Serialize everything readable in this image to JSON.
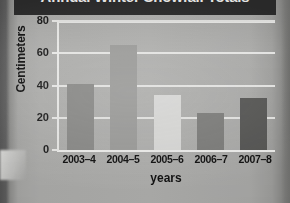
{
  "chart": {
    "title": "Annual Winter Snowfall Totals",
    "xlabel": "years",
    "ylabel": "Centimeters"
  },
  "chart_data": {
    "type": "bar",
    "title": "Annual Winter Snowfall Totals",
    "xlabel": "years",
    "ylabel": "Centimeters",
    "categories": [
      "2003–4",
      "2004–5",
      "2005–6",
      "2006–7",
      "2007–8"
    ],
    "values": [
      41,
      65,
      34,
      23,
      32
    ],
    "ylim": [
      0,
      80
    ],
    "yticks": [
      0,
      20,
      40,
      60,
      80
    ],
    "ytick_labels": [
      "0",
      "20",
      "40",
      "60",
      "80"
    ],
    "grid": "horizontal",
    "legend": "none",
    "bar_colors": [
      "#8a8a88",
      "#9c9c9a",
      "#d9d9d7",
      "#7d7d7b",
      "#565654"
    ]
  },
  "colors": {
    "title_band": "#2c2c2c",
    "title_text": "#f2f2f0",
    "plot_background": "#b0b0ae",
    "gridline": "#e4e4e2",
    "axis": "#e8e8e6",
    "text": "#111111"
  }
}
